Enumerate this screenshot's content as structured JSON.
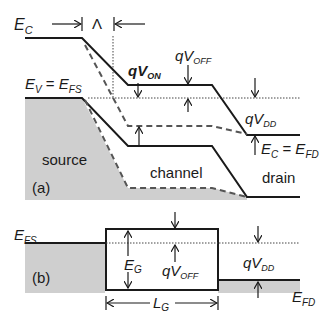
{
  "diagram": {
    "colors": {
      "line": "#1a1a1a",
      "fill_gray": "#cfcfcf",
      "dashed": "#555555",
      "background": "#ffffff"
    },
    "panel_a": {
      "tag": "(a)",
      "labels": {
        "ec": {
          "main": "E",
          "sub": "C"
        },
        "lambda": "Λ",
        "ev_efs": {
          "a": "E",
          "a_sub": "V",
          "eq": " = ",
          "b": "E",
          "b_sub": "FS"
        },
        "qvon": {
          "main": "qV",
          "sub": "ON"
        },
        "qvoff": {
          "main": "qV",
          "sub": "OFF"
        },
        "qvdd": {
          "main": "qV",
          "sub": "DD"
        },
        "ec_efd": {
          "a": "E",
          "a_sub": "C",
          "eq": " = ",
          "b": "E",
          "b_sub": "FD"
        },
        "source": "source",
        "channel": "channel",
        "drain": "drain"
      }
    },
    "panel_b": {
      "tag": "(b)",
      "labels": {
        "efs": {
          "main": "E",
          "sub": "FS"
        },
        "eg": {
          "main": "E",
          "sub": "G"
        },
        "qvoff": {
          "main": "qV",
          "sub": "OFF"
        },
        "qvdd": {
          "main": "qV",
          "sub": "DD"
        },
        "efd": {
          "main": "E",
          "sub": "FD"
        },
        "lg": {
          "main": "L",
          "sub": "G"
        }
      }
    }
  }
}
